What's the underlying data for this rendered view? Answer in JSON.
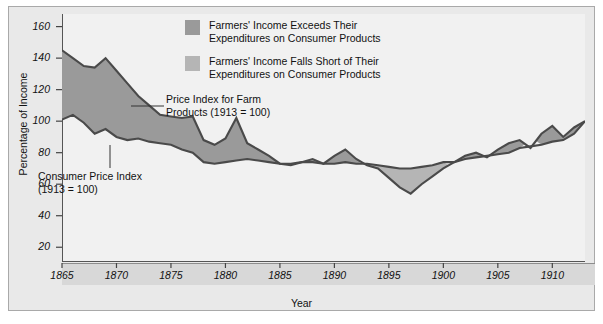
{
  "chart_data": {
    "type": "area",
    "title": "",
    "xlabel": "Year",
    "ylabel": "Percentage of Income",
    "xlim": [
      1865,
      1913
    ],
    "ylim": [
      10,
      168
    ],
    "yticks": [
      20,
      40,
      60,
      80,
      100,
      120,
      140,
      160
    ],
    "xticks": [
      1865,
      1870,
      1875,
      1880,
      1885,
      1890,
      1895,
      1900,
      1905,
      1910
    ],
    "grid": false,
    "legend_position": "top-center",
    "fill_above_color": "#9a9a9a",
    "fill_below_color": "#b5b5b5",
    "line_color": "#4a4a4a",
    "plot_bg": "#f1f1f1",
    "figure_bg": "#e9e9e9",
    "x": [
      1865,
      1866,
      1867,
      1868,
      1869,
      1870,
      1871,
      1872,
      1873,
      1874,
      1875,
      1876,
      1877,
      1878,
      1879,
      1880,
      1881,
      1882,
      1883,
      1884,
      1885,
      1886,
      1887,
      1888,
      1889,
      1890,
      1891,
      1892,
      1893,
      1894,
      1895,
      1896,
      1897,
      1898,
      1899,
      1900,
      1901,
      1902,
      1903,
      1904,
      1905,
      1906,
      1907,
      1908,
      1909,
      1910,
      1911,
      1912,
      1913
    ],
    "series": [
      {
        "name": "Price Index for Farm Products (1913 = 100)",
        "values": [
          145,
          140,
          135,
          134,
          140,
          132,
          124,
          116,
          110,
          104,
          103,
          102,
          103,
          88,
          85,
          89,
          102,
          86,
          82,
          78,
          73,
          72,
          74,
          76,
          73,
          78,
          82,
          76,
          72,
          70,
          64,
          58,
          54,
          60,
          65,
          70,
          74,
          78,
          80,
          77,
          82,
          86,
          88,
          83,
          92,
          97,
          90,
          96,
          100
        ]
      },
      {
        "name": "Consumer Price Index (1913 = 100)",
        "values": [
          101,
          104,
          99,
          92,
          95,
          90,
          88,
          89,
          87,
          86,
          85,
          82,
          80,
          74,
          73,
          74,
          75,
          76,
          75,
          74,
          73,
          73,
          74,
          74,
          73,
          73,
          74,
          73,
          73,
          72,
          71,
          70,
          70,
          71,
          72,
          74,
          74,
          76,
          77,
          78,
          79,
          80,
          83,
          84,
          85,
          87,
          88,
          92,
          100
        ]
      }
    ],
    "annotations": [
      {
        "name": "farm-products-label",
        "text": "Price Index for Farm\nProducts (1913 = 100)"
      },
      {
        "name": "consumer-price-index-label",
        "text": "Consumer Price Index\n(1913 = 100)"
      }
    ]
  },
  "legend": {
    "items": [
      {
        "swatch": "#9a9a9a",
        "label": "Farmers' Income Exceeds Their\nExpenditures on Consumer Products"
      },
      {
        "swatch": "#b5b5b5",
        "label": "Farmers' Income Falls Short of Their\nExpenditures on Consumer Products"
      }
    ]
  }
}
